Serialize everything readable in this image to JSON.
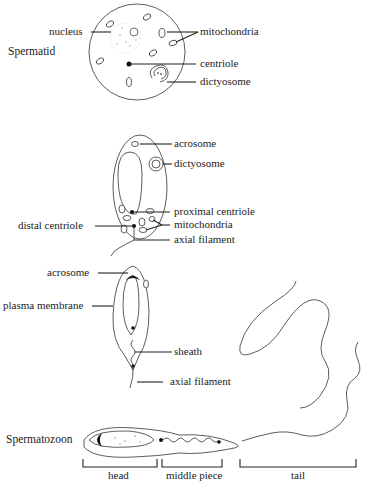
{
  "stages": [
    {
      "title": "Spermatid",
      "labels": {
        "nucleus": "nucleus",
        "mitochondria": "mitochondria",
        "centriole": "centriole",
        "dictyosome": "dictyosome"
      }
    },
    {
      "title": "",
      "labels": {
        "acrosome": "acrosome",
        "dictyosome": "dictyosome",
        "proximal_centriole": "proximal centriole",
        "distal_centriole": "distal centriole",
        "mitochondria": "mitochondria",
        "axial_filament": "axial filament"
      }
    },
    {
      "title": "",
      "labels": {
        "acrosome": "acrosome",
        "plasma_membrane": "plasma membrane",
        "sheath": "sheath",
        "axial_filament": "axial filament"
      }
    },
    {
      "title": "Spermatozoon",
      "regions": {
        "head": "head",
        "middle_piece": "middle piece",
        "tail": "tail"
      }
    }
  ]
}
